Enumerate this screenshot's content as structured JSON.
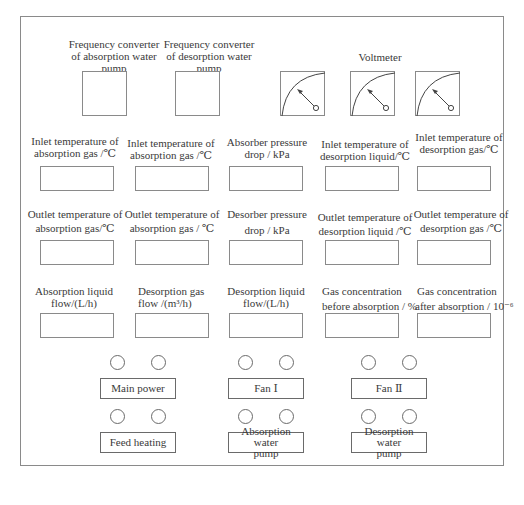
{
  "converters": [
    {
      "label_lines": [
        "Frequency converter",
        "of absorption water",
        "pump"
      ]
    },
    {
      "label_lines": [
        "Frequency converter",
        "of desorption water",
        "pump"
      ]
    }
  ],
  "voltmeter": {
    "label": "Voltmeter",
    "count": 3
  },
  "displays": {
    "row1": [
      {
        "line1": "Inlet temperature of",
        "line2": "absorption gas /℃"
      },
      {
        "line1": "Inlet temperature of",
        "line2": "absorption gas /℃"
      },
      {
        "line1": "Absorber pressure",
        "line2": "drop / kPa"
      },
      {
        "line1": "Inlet temperature of",
        "line2": "desorption  liquid/℃"
      },
      {
        "line1": "Inlet temperature of",
        "line2": "desorption gas/℃"
      }
    ],
    "row2": [
      {
        "line1": "Outlet temperature of",
        "line2": "absorption gas/℃"
      },
      {
        "line1": "Outlet temperature of",
        "line2": "absorption gas / ℃"
      },
      {
        "line1": "Desorber pressure",
        "line2": "drop / kPa"
      },
      {
        "line1": "Outlet temperature of",
        "line2": "desorption  liquid /℃"
      },
      {
        "line1": "Outlet temperature of",
        "line2": "desorption gas /℃"
      }
    ],
    "row3": [
      {
        "line1": "Absorption liquid",
        "line2": "flow/(L/h)"
      },
      {
        "line1": "Desorption gas",
        "line2": "flow /(m³/h)"
      },
      {
        "line1": "Desorption liquid",
        "line2": "flow/(L/h)"
      },
      {
        "line1": "Gas concentration",
        "line2": "before absorption / %"
      },
      {
        "line1": "Gas concentration",
        "line2": "after absorption / 10⁻⁶"
      }
    ]
  },
  "controls": [
    {
      "label_lines": [
        "Main power"
      ]
    },
    {
      "label_lines": [
        "Fan Ⅰ"
      ]
    },
    {
      "label_lines": [
        "Fan Ⅱ"
      ]
    },
    {
      "label_lines": [
        "Feed heating"
      ]
    },
    {
      "label_lines": [
        "Absorption water",
        "pump"
      ]
    },
    {
      "label_lines": [
        "Desorption water",
        "pump"
      ]
    }
  ]
}
